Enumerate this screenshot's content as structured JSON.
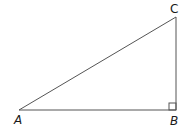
{
  "diagram": {
    "type": "right-triangle",
    "vertices": [
      {
        "name": "A",
        "label": "A",
        "x": 19,
        "y": 110
      },
      {
        "name": "B",
        "label": "B",
        "x": 176,
        "y": 110
      },
      {
        "name": "C",
        "label": "C",
        "x": 176,
        "y": 17
      }
    ],
    "right_angle_at": "B",
    "line_color": "#555555",
    "label_color": "#1a1a1a"
  }
}
